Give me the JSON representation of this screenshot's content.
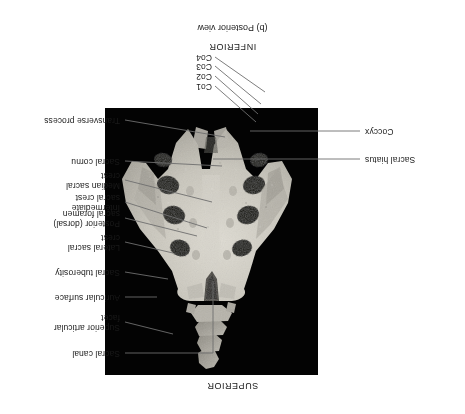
{
  "figure": {
    "caption": "(b) Posterior view",
    "orientation_top": "INFERIOR",
    "orientation_bottom": "SUPERIOR",
    "plate_background_color": "#030303",
    "bone_color": "#c9c6bd"
  },
  "labels": {
    "left": [
      {
        "id": "transverse-process",
        "text": "Transverse process"
      },
      {
        "id": "sacral-cornu",
        "text": "Sacral cornu"
      },
      {
        "id": "median-sacral-crest",
        "text": "Median sacral\ncrest"
      },
      {
        "id": "intermediate-sacral-crest",
        "text": "Intermediate\nsacral crest"
      },
      {
        "id": "posterior-sacral-foramen",
        "text": "Posterior (dorsal)\nsacral foramen"
      },
      {
        "id": "lateral-sacral-crest",
        "text": "Lateral sacral\ncrest"
      },
      {
        "id": "sacral-tuberosity",
        "text": "Sacral tuberosity"
      },
      {
        "id": "auricular-surface",
        "text": "Auricular surface"
      },
      {
        "id": "superior-articular-facet",
        "text": "Superior articular\nfacet"
      },
      {
        "id": "sacral-canal",
        "text": "Sacral canal"
      }
    ],
    "right": [
      {
        "id": "coccyx",
        "text": "Coccyx"
      },
      {
        "id": "sacral-hiatus",
        "text": "Sacral hiatus"
      }
    ],
    "coccygeal": [
      {
        "id": "co4",
        "text": "Co4"
      },
      {
        "id": "co3",
        "text": "Co3"
      },
      {
        "id": "co2",
        "text": "Co2"
      },
      {
        "id": "co1",
        "text": "Co1"
      }
    ]
  }
}
